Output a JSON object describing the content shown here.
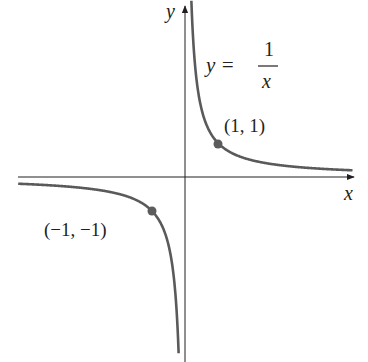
{
  "chart_data": {
    "type": "line",
    "title": "",
    "function": "y = 1/x",
    "xlabel": "x",
    "ylabel": "y",
    "equation_label": {
      "lhs": "y =",
      "numerator": "1",
      "denominator": "x"
    },
    "series": [
      {
        "name": "y = 1/x (x > 0)",
        "x": [
          0.12,
          0.2,
          0.3,
          0.5,
          0.75,
          1,
          1.5,
          2,
          3,
          4,
          5
        ],
        "y": [
          8.33,
          5,
          3.33,
          2,
          1.33,
          1,
          0.67,
          0.5,
          0.33,
          0.25,
          0.2
        ]
      },
      {
        "name": "y = 1/x (x < 0)",
        "x": [
          -5,
          -4,
          -3,
          -2,
          -1.5,
          -1,
          -0.75,
          -0.5,
          -0.3,
          -0.2,
          -0.18
        ],
        "y": [
          -0.2,
          -0.25,
          -0.33,
          -0.5,
          -0.67,
          -1,
          -1.33,
          -2,
          -3.33,
          -5,
          -5.56
        ]
      }
    ],
    "points": [
      {
        "x": 1,
        "y": 1,
        "label": "(1, 1)"
      },
      {
        "x": -1,
        "y": -1,
        "label": "(−1, −1)"
      }
    ],
    "xlim": [
      -5,
      5
    ],
    "ylim": [
      -5.5,
      5.3
    ],
    "grid": false,
    "legend": null,
    "colors": {
      "curve": "#5a5a5a",
      "axis": "#231f20",
      "point": "#5c5c5c"
    }
  }
}
